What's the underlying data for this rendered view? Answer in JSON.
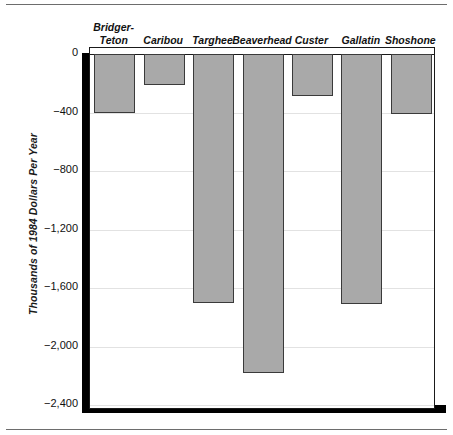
{
  "chart_data": {
    "type": "bar",
    "title": "",
    "subtitle": "",
    "xlabel": "",
    "ylabel": "Thousands of 1984 Dollars Per Year",
    "categories": [
      "Bridger-\nTeton",
      "Caribou",
      "Targhee",
      "Beaverhead",
      "Custer",
      "Gallatin",
      "Shoshone"
    ],
    "values": [
      -400,
      -210,
      -1700,
      -2180,
      -290,
      -1710,
      -410
    ],
    "ylim": [
      -2400,
      0
    ],
    "yticks": [
      0,
      -400,
      -800,
      -1200,
      -1600,
      -2000,
      -2400
    ],
    "ytick_labels": [
      "0",
      "−400",
      "−800",
      "−1,200",
      "−1,600",
      "−2,000",
      "−2,400"
    ],
    "grid": true,
    "legend": "none",
    "orientation": "vertical",
    "category_label_position": "top",
    "bar_color": "#a9a9a9",
    "bar_edge_color": "#3a3a3a",
    "axis_color": "#1a1a1a",
    "grid_color": "#e2e2e2",
    "shadow_color": "#000000"
  }
}
